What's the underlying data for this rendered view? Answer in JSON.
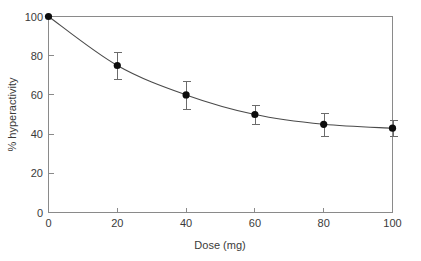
{
  "chart_data": {
    "type": "line",
    "title": "",
    "xlabel": "Dose (mg)",
    "ylabel": "% hyperactivity",
    "xlim": [
      0,
      100
    ],
    "ylim": [
      0,
      100
    ],
    "xticks": [
      0,
      20,
      40,
      60,
      80,
      100
    ],
    "yticks": [
      0,
      20,
      40,
      60,
      80,
      100
    ],
    "xtick_labels": [
      "0",
      "20",
      "40",
      "60",
      "80",
      "100"
    ],
    "ytick_labels": [
      "0",
      "20",
      "40",
      "60",
      "80",
      "100"
    ],
    "grid": false,
    "legend": false,
    "legend_position": "none",
    "frame": "box",
    "x": [
      0,
      20,
      40,
      60,
      80,
      100
    ],
    "series": [
      {
        "name": "% hyperactivity",
        "values": [
          100,
          75,
          60,
          50,
          45,
          43
        ],
        "errors": [
          0,
          7,
          7,
          5,
          6,
          4
        ],
        "marker": "filled-circle",
        "marker_color": "#0d0d0d",
        "line_color": "#4a4a4a"
      }
    ],
    "points": [
      {
        "x": 0,
        "y": 100,
        "err": 0
      },
      {
        "x": 20,
        "y": 75,
        "err": 7
      },
      {
        "x": 40,
        "y": 60,
        "err": 7
      },
      {
        "x": 60,
        "y": 50,
        "err": 5
      },
      {
        "x": 80,
        "y": 45,
        "err": 6
      },
      {
        "x": 100,
        "y": 43,
        "err": 4
      }
    ],
    "annotations": []
  },
  "axes": {
    "x_title": "Dose (mg)",
    "y_title": "% hyperactivity"
  },
  "colors": {
    "background": "#ffffff",
    "frame": "#8a8a8a",
    "line": "#4a4a4a",
    "marker": "#0d0d0d",
    "errorbar": "#6b6b6b",
    "text": "#3a3a3a"
  }
}
